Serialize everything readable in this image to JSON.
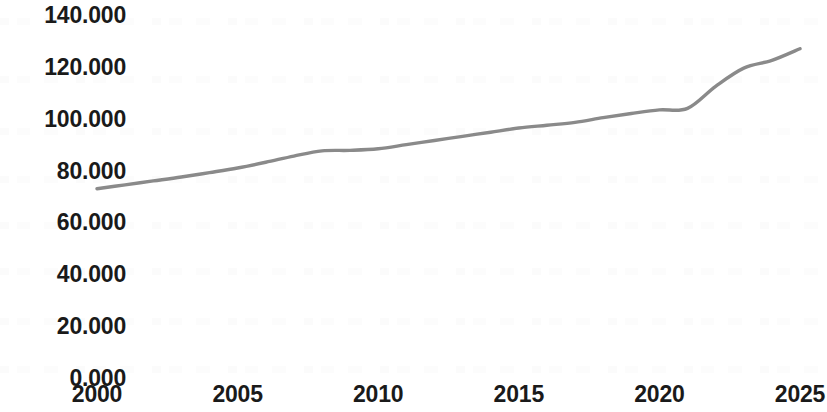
{
  "chart_data": {
    "type": "line",
    "title": "",
    "subtitle": "",
    "xlabel": "",
    "ylabel": "",
    "xlim": [
      2000,
      2025
    ],
    "ylim": [
      0,
      140
    ],
    "grid": false,
    "legend": null,
    "legend_position": "none",
    "y_tick_labels": [
      "140.000",
      "120.000",
      "100.000",
      "80.000",
      "60.000",
      "40.000",
      "20.000",
      "0.000"
    ],
    "y_tick_values": [
      140,
      120,
      100,
      80,
      60,
      40,
      20,
      0
    ],
    "x_tick_labels": [
      "2000",
      "2005",
      "2010",
      "2015",
      "2020",
      "2025"
    ],
    "x_tick_values": [
      2000,
      2005,
      2010,
      2015,
      2020,
      2025
    ],
    "series": [
      {
        "name": "value",
        "color": "#8a8a8a",
        "x": [
          2000,
          2001,
          2002,
          2003,
          2004,
          2005,
          2006,
          2007,
          2008,
          2009,
          2010,
          2011,
          2012,
          2013,
          2014,
          2015,
          2016,
          2017,
          2018,
          2019,
          2020,
          2021,
          2022,
          2023,
          2024,
          2025
        ],
        "values": [
          73.0,
          74.5,
          76.0,
          77.5,
          79.2,
          81.0,
          83.2,
          85.6,
          87.6,
          87.8,
          88.4,
          90.0,
          91.6,
          93.2,
          94.8,
          96.4,
          97.5,
          98.6,
          100.4,
          102.0,
          103.4,
          104.0,
          112.5,
          119.5,
          122.5,
          127.0
        ]
      }
    ]
  },
  "axes": {
    "y_labels": [
      {
        "text": "140.000",
        "value": 140
      },
      {
        "text": "120.000",
        "value": 120
      },
      {
        "text": "100.000",
        "value": 100
      },
      {
        "text": "80.000",
        "value": 80
      },
      {
        "text": "60.000",
        "value": 60
      },
      {
        "text": "40.000",
        "value": 40
      },
      {
        "text": "20.000",
        "value": 20
      },
      {
        "text": "0.000",
        "value": 0
      }
    ],
    "x_labels": [
      {
        "text": "2000",
        "value": 2000
      },
      {
        "text": "2005",
        "value": 2005
      },
      {
        "text": "2010",
        "value": 2010
      },
      {
        "text": "2015",
        "value": 2015
      },
      {
        "text": "2020",
        "value": 2020
      },
      {
        "text": "2025",
        "value": 2025
      }
    ]
  },
  "style": {
    "background": "#ffffff",
    "text_color": "#1a1a1a",
    "line_color": "#8a8a8a"
  }
}
